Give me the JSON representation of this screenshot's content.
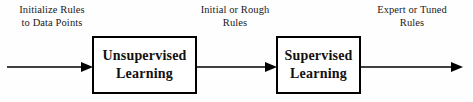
{
  "diagram": {
    "background_color": "#fefefe",
    "stroke_color": "#000000",
    "text_color": "#1a1a1a"
  },
  "captions": {
    "initialize": {
      "line1": "Initialize Rules",
      "line2": "to Data Points"
    },
    "rough": {
      "line1": "Initial or Rough",
      "line2": "Rules"
    },
    "expert": {
      "line1": "Expert or Tuned",
      "line2": "Rules"
    }
  },
  "boxes": {
    "unsupervised": {
      "line1": "Unsupervised",
      "line2": "Learning"
    },
    "supervised": {
      "line1": "Supervised",
      "line2": "Learning"
    }
  },
  "arrows": {
    "input": "arrow-right",
    "middle": "arrow-right",
    "output": "arrow-right"
  }
}
